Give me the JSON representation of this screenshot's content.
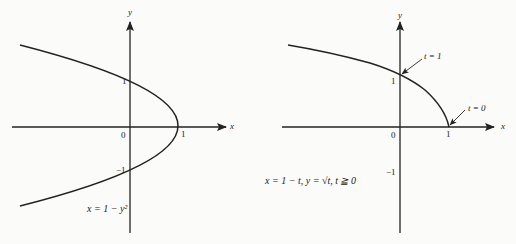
{
  "left_plot": {
    "axis_x_label": "x",
    "axis_y_label": "y",
    "origin_label": "0",
    "x_tick_1": "1",
    "y_tick_1": "1",
    "y_tick_neg1": "−1",
    "equation": "x = 1 − y²"
  },
  "right_plot": {
    "axis_x_label": "x",
    "axis_y_label": "y",
    "origin_label": "0",
    "x_tick_1": "1",
    "y_tick_1": "1",
    "y_tick_neg1": "−1",
    "annotation_t1": "t = 1",
    "annotation_t0": "t = 0",
    "equation": "x = 1 − t, y = √t, t ≧ 0"
  },
  "colors": {
    "ink": "#222222",
    "background": "#fbfbf9"
  }
}
